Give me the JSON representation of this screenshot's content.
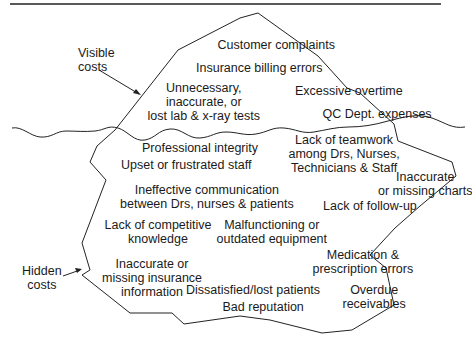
{
  "diagram": {
    "type": "iceberg",
    "colors": {
      "line": "#222222",
      "text": "#1a1a1a",
      "background": "#ffffff"
    },
    "callouts": {
      "visible": "Visible\ncosts",
      "hidden": "Hidden\ncosts"
    },
    "visible_costs": [
      {
        "text": "Customer complaints",
        "x": 276,
        "y": 45
      },
      {
        "text": "Insurance billing errors",
        "x": 259,
        "y": 68
      },
      {
        "text": "Excessive overtime",
        "x": 349,
        "y": 91
      },
      {
        "text": "Unnecessary,\ninaccurate, or\nlost lab & x-ray tests",
        "x": 204,
        "y": 88
      },
      {
        "text": "QC Dept. expenses",
        "x": 377,
        "y": 114
      }
    ],
    "hidden_costs": [
      {
        "text": "Professional integrity",
        "x": 200,
        "y": 148
      },
      {
        "text": "Lack of teamwork\namong Drs, Nurses,\nTechnicians & Staff",
        "x": 344,
        "y": 140
      },
      {
        "text": "Upset or frustrated staff",
        "x": 186,
        "y": 165
      },
      {
        "text": "Inaccurate\nor missing charts",
        "x": 425,
        "y": 177
      },
      {
        "text": "Ineffective communication\nbetween Drs, nurses & patients",
        "x": 207,
        "y": 190
      },
      {
        "text": "Lack of follow-up",
        "x": 370,
        "y": 206
      },
      {
        "text": "Lack of competitive\nknowledge",
        "x": 158,
        "y": 225
      },
      {
        "text": "Malfunctioning or\noutdated equipment",
        "x": 272,
        "y": 225
      },
      {
        "text": "Medication &\nprescription errors",
        "x": 363,
        "y": 255
      },
      {
        "text": "Inaccurate or\nmissing insurance\ninformation",
        "x": 152,
        "y": 264
      },
      {
        "text": "Dissatisfied/lost patients",
        "x": 253,
        "y": 290
      },
      {
        "text": "Overdue\nreceivables",
        "x": 374,
        "y": 290
      },
      {
        "text": "Bad reputation",
        "x": 263,
        "y": 307
      }
    ]
  }
}
